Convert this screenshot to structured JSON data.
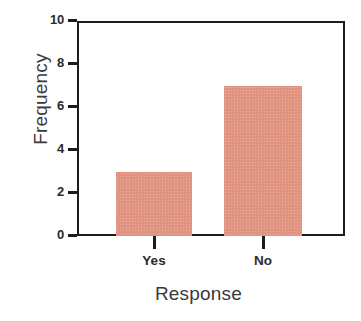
{
  "chart_data": {
    "type": "bar",
    "title": "",
    "xlabel": "Response",
    "ylabel": "Frequency",
    "categories": [
      "Yes",
      "No"
    ],
    "values": [
      3,
      7
    ],
    "ylim": [
      0,
      10
    ],
    "yticks": [
      "0",
      "2",
      "4",
      "6",
      "8",
      "10"
    ],
    "ytick_values": [
      0,
      2,
      4,
      6,
      8,
      10
    ],
    "grid": false,
    "legend": "none",
    "bar_color": "#e0937f",
    "axis_color": "#1c1c1c",
    "background": "#ffffff"
  }
}
